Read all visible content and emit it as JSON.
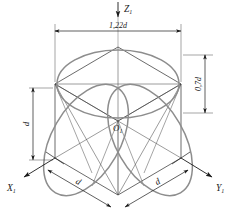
{
  "figure": {
    "type": "isometric-projection-of-sphere-in-cube",
    "background_color": "#ffffff",
    "line_color": "#2b2b2b",
    "ellipse_color": "#8a8a8a",
    "thin_line_color": "#555555"
  },
  "axes": {
    "z": {
      "label": "Z",
      "subscript": "1",
      "name": "z-axis",
      "direction": "down"
    },
    "x": {
      "label": "X",
      "subscript": "1",
      "name": "x-axis",
      "direction": "down-left"
    },
    "y": {
      "label": "Y",
      "subscript": "1",
      "name": "y-axis",
      "direction": "down-right"
    }
  },
  "origin": {
    "label": "O",
    "subscript": "1"
  },
  "dimensions": {
    "top_width": "1,22d",
    "right_height": "0,7d",
    "left_vertical": "d",
    "bottom_left": "d",
    "bottom_right": "d"
  }
}
